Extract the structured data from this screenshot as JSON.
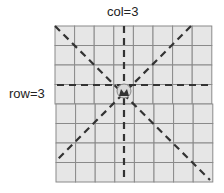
{
  "diagram": {
    "col_label": "col=3",
    "row_label": "row=3",
    "grid": {
      "rows": 8,
      "cols": 8
    },
    "piece": {
      "type": "queen-icon",
      "row": 3,
      "col": 3
    },
    "colors": {
      "cell_fill": "#e6e6e6",
      "cell_border": "#8a8a8a",
      "line": "#333333"
    }
  }
}
